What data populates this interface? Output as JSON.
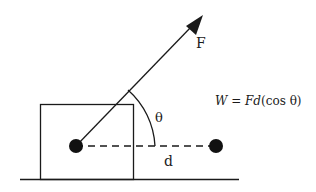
{
  "diagram": {
    "force_label": "F",
    "angle_label": "θ",
    "distance_label": "d",
    "equation": {
      "W": "W",
      "eq": " = ",
      "Fd": "Fd",
      "paren": "(cos θ)"
    },
    "colors": {
      "stroke": "#1a1a1a",
      "background": "#ffffff"
    }
  }
}
